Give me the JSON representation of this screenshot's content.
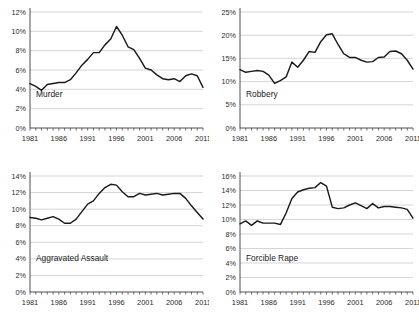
{
  "figure": {
    "panel_order": [
      "murder",
      "robbery",
      "aggravated_assault",
      "forcible_rape"
    ]
  },
  "chart_data": [
    {
      "type": "line",
      "title": "Murder",
      "xlabel": "",
      "ylabel": "",
      "grid": true,
      "legend": "inside-plot-lower-left",
      "xlim": [
        1981,
        2011
      ],
      "ylim": [
        0,
        12
      ],
      "ytick_labels": [
        "0%",
        "2%",
        "4%",
        "6%",
        "8%",
        "10%",
        "12%"
      ],
      "ytick_values": [
        0,
        2,
        4,
        6,
        8,
        10,
        12
      ],
      "xtick_labels": [
        "1981",
        "1986",
        "1991",
        "1996",
        "2001",
        "2006",
        "2011"
      ],
      "xtick_values": [
        1981,
        1986,
        1991,
        1996,
        2001,
        2006,
        2011
      ],
      "x": [
        1981,
        1982,
        1983,
        1984,
        1985,
        1986,
        1987,
        1988,
        1989,
        1990,
        1991,
        1992,
        1993,
        1994,
        1995,
        1996,
        1997,
        1998,
        1999,
        2000,
        2001,
        2002,
        2003,
        2004,
        2005,
        2006,
        2007,
        2008,
        2009,
        2010,
        2011
      ],
      "values": [
        4.6,
        4.3,
        3.9,
        4.5,
        4.6,
        4.7,
        4.7,
        5.0,
        5.7,
        6.5,
        7.1,
        7.8,
        7.8,
        8.6,
        9.2,
        10.5,
        9.6,
        8.4,
        8.1,
        7.2,
        6.2,
        6.0,
        5.5,
        5.1,
        5.0,
        5.1,
        4.8,
        5.4,
        5.6,
        5.4,
        4.2
      ],
      "series_label": "Murder"
    },
    {
      "type": "line",
      "title": "Robbery",
      "xlabel": "",
      "ylabel": "",
      "grid": true,
      "legend": "inside-plot-lower-left",
      "xlim": [
        1981,
        2011
      ],
      "ylim": [
        0,
        25
      ],
      "ytick_labels": [
        "0%",
        "5%",
        "10%",
        "15%",
        "20%",
        "25%"
      ],
      "ytick_values": [
        0,
        5,
        10,
        15,
        20,
        25
      ],
      "xtick_labels": [
        "1981",
        "1986",
        "1991",
        "1996",
        "2001",
        "2006",
        "2011"
      ],
      "xtick_values": [
        1981,
        1986,
        1991,
        1996,
        2001,
        2006,
        2011
      ],
      "x": [
        1981,
        1982,
        1983,
        1984,
        1985,
        1986,
        1987,
        1988,
        1989,
        1990,
        1991,
        1992,
        1993,
        1994,
        1995,
        1996,
        1997,
        1998,
        1999,
        2000,
        2001,
        2002,
        2003,
        2004,
        2005,
        2006,
        2007,
        2008,
        2009,
        2010,
        2011
      ],
      "values": [
        12.6,
        12.0,
        12.2,
        12.4,
        12.2,
        11.4,
        9.6,
        10.2,
        11.0,
        14.2,
        13.1,
        14.6,
        16.5,
        16.3,
        18.6,
        20.1,
        20.3,
        18.0,
        16.0,
        15.2,
        15.2,
        14.6,
        14.2,
        14.3,
        15.2,
        15.3,
        16.5,
        16.6,
        16.0,
        14.6,
        12.7
      ],
      "series_label": "Robbery"
    },
    {
      "type": "line",
      "title": "Aggravated Assault",
      "xlabel": "",
      "ylabel": "",
      "grid": true,
      "legend": "inside-plot-lower-left",
      "xlim": [
        1981,
        2011
      ],
      "ylim": [
        0,
        14
      ],
      "ytick_labels": [
        "0%",
        "2%",
        "4%",
        "6%",
        "8%",
        "10%",
        "12%",
        "14%"
      ],
      "ytick_values": [
        0,
        2,
        4,
        6,
        8,
        10,
        12,
        14
      ],
      "xtick_labels": [
        "1981",
        "1986",
        "1991",
        "1996",
        "2001",
        "2006",
        "2011"
      ],
      "xtick_values": [
        1981,
        1986,
        1991,
        1996,
        2001,
        2006,
        2011
      ],
      "x": [
        1981,
        1982,
        1983,
        1984,
        1985,
        1986,
        1987,
        1988,
        1989,
        1990,
        1991,
        1992,
        1993,
        1994,
        1995,
        1996,
        1997,
        1998,
        1999,
        2000,
        2001,
        2002,
        2003,
        2004,
        2005,
        2006,
        2007,
        2008,
        2009,
        2010,
        2011
      ],
      "values": [
        9.0,
        8.9,
        8.7,
        8.9,
        9.1,
        8.8,
        8.3,
        8.3,
        8.8,
        9.7,
        10.6,
        11.0,
        11.9,
        12.6,
        13.0,
        12.9,
        12.1,
        11.5,
        11.5,
        11.9,
        11.7,
        11.8,
        11.9,
        11.7,
        11.8,
        11.9,
        11.9,
        11.3,
        10.4,
        9.6,
        8.8
      ],
      "series_label": "Aggravated Assault"
    },
    {
      "type": "line",
      "title": "Forcible Rape",
      "xlabel": "",
      "ylabel": "",
      "grid": true,
      "legend": "inside-plot-lower-left",
      "xlim": [
        1981,
        2011
      ],
      "ylim": [
        0,
        16
      ],
      "ytick_labels": [
        "0%",
        "2%",
        "4%",
        "6%",
        "8%",
        "10%",
        "12%",
        "14%",
        "16%"
      ],
      "ytick_values": [
        0,
        2,
        4,
        6,
        8,
        10,
        12,
        14,
        16
      ],
      "xtick_labels": [
        "1981",
        "1986",
        "1991",
        "1996",
        "2001",
        "2006",
        "2011"
      ],
      "xtick_values": [
        1981,
        1986,
        1991,
        1996,
        2001,
        2006,
        2011
      ],
      "x": [
        1981,
        1982,
        1983,
        1984,
        1985,
        1986,
        1987,
        1988,
        1989,
        1990,
        1991,
        1992,
        1993,
        1994,
        1995,
        1996,
        1997,
        1998,
        1999,
        2000,
        2001,
        2002,
        2003,
        2004,
        2005,
        2006,
        2007,
        2008,
        2009,
        2010,
        2011
      ],
      "values": [
        9.4,
        9.8,
        9.2,
        9.8,
        9.5,
        9.5,
        9.5,
        9.3,
        10.9,
        12.9,
        13.8,
        14.1,
        14.3,
        14.4,
        15.1,
        14.6,
        11.7,
        11.5,
        11.6,
        12.0,
        12.3,
        11.9,
        11.5,
        12.2,
        11.6,
        11.8,
        11.8,
        11.7,
        11.6,
        11.4,
        10.2
      ],
      "series_label": "Forcible Rape"
    }
  ],
  "colors": {
    "line": "#1a1a1a",
    "gridline": "#b9b9b9",
    "axis": "#3a3a3a",
    "background": "#ffffff",
    "text": "#2b2b2b"
  }
}
